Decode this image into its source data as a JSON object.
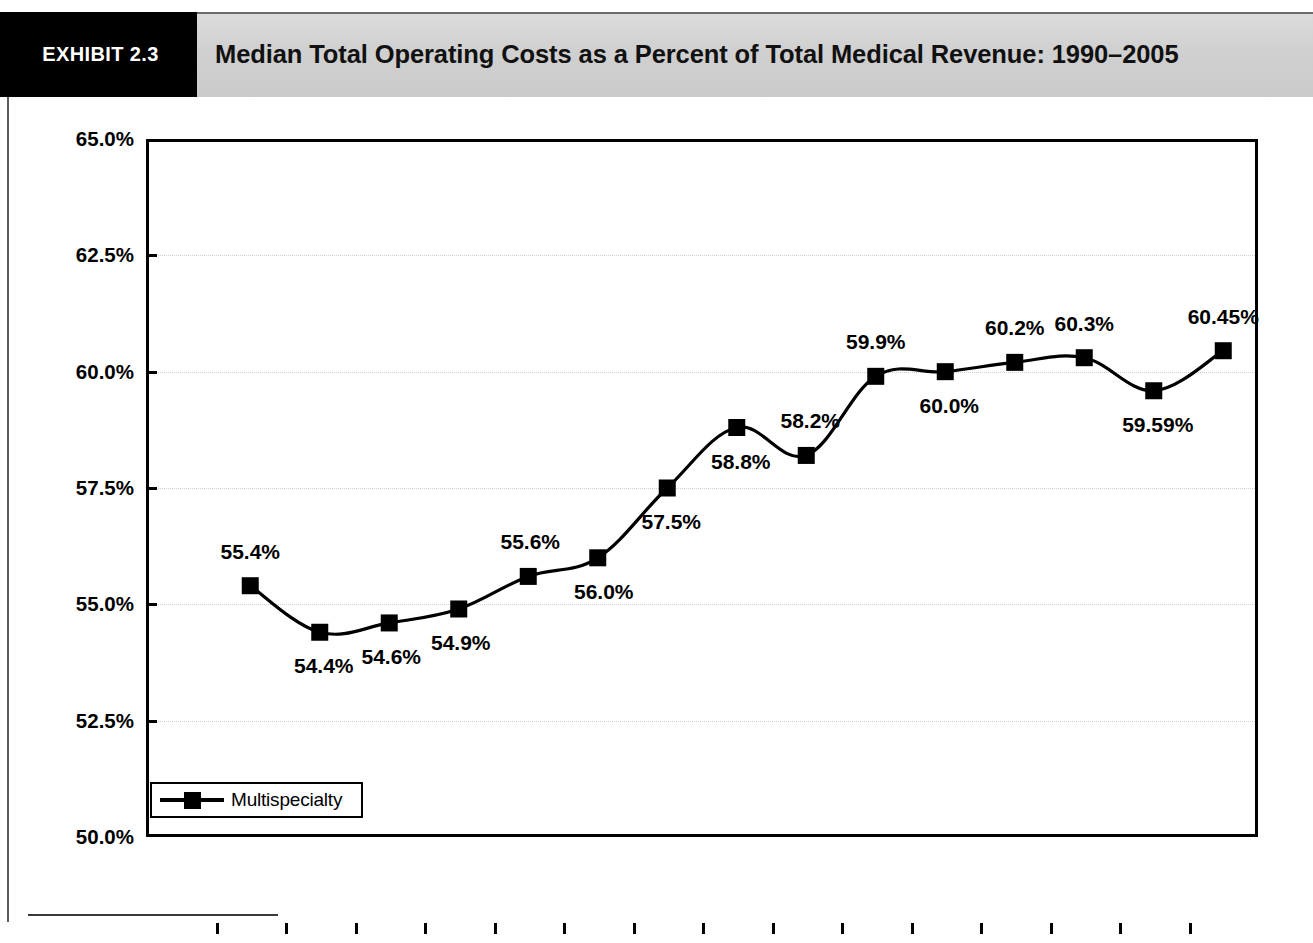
{
  "header": {
    "exhibit_tag": "EXHIBIT 2.3",
    "title": "Median Total Operating Costs as a Percent of Total Medical Revenue: 1990–2005"
  },
  "chart_data": {
    "type": "line",
    "title": "Median Total Operating Costs as a Percent of Total Medical Revenue: 1990–2005",
    "xlabel": "Year",
    "ylabel": "",
    "xlim": [
      1990,
      2005
    ],
    "ylim": [
      50.0,
      65.0
    ],
    "grid": true,
    "legend_position": "bottom-left",
    "categories": [
      "1990",
      "1991",
      "1992",
      "1993",
      "1994",
      "1995",
      "1996",
      "1997",
      "1998",
      "1999",
      "2000",
      "2001",
      "2002",
      "2003",
      "2004",
      "2005"
    ],
    "x_tick_labels": [
      "1990",
      "1991",
      "1992",
      "1993",
      "1994",
      "1995",
      "1996",
      "1997",
      "1998",
      "1999",
      "2000",
      "2001",
      "2002",
      "2003",
      "2004",
      "2005"
    ],
    "y_tick_labels": [
      "65.0%",
      "62.5%",
      "60.0%",
      "57.5%",
      "55.0%",
      "52.5%",
      "50.0%"
    ],
    "y_tick_values": [
      65.0,
      62.5,
      60.0,
      57.5,
      55.0,
      52.5,
      50.0
    ],
    "series": [
      {
        "name": "Multispecialty",
        "color": "#000000",
        "marker": "square",
        "x": [
          "1991",
          "1992",
          "1993",
          "1994",
          "1995",
          "1996",
          "1997",
          "1998",
          "1999",
          "2000",
          "2001",
          "2002",
          "2003",
          "2004",
          "2005"
        ],
        "values": [
          55.4,
          54.4,
          54.6,
          54.9,
          55.6,
          56.0,
          57.5,
          58.8,
          58.2,
          59.9,
          60.0,
          60.2,
          60.3,
          59.59,
          60.45
        ],
        "point_labels": [
          "55.4%",
          "54.4%",
          "54.6%",
          "54.9%",
          "55.6%",
          "56.0%",
          "57.5%",
          "58.8%",
          "58.2%",
          "59.9%",
          "60.0%",
          "60.2%",
          "60.3%",
          "59.59%",
          "60.45%"
        ]
      }
    ],
    "legend": [
      "Multispecialty"
    ]
  },
  "colors": {
    "header_band": "#d2d2d2",
    "exhibit_tag_bg": "#000000",
    "series": "#000000",
    "gridline": "#cfcfcf"
  }
}
